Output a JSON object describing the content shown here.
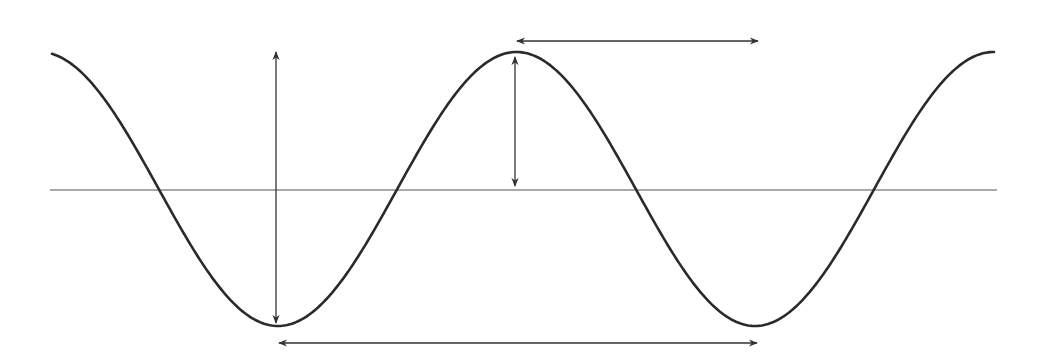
{
  "diagram": {
    "title": "",
    "colors": {
      "background": "#ffffff",
      "wave": "#2a2a2a",
      "axis": "#555555",
      "arrows": "#333333"
    },
    "axis": {
      "x1": 50,
      "y": 190,
      "x2": 997
    },
    "wave": {
      "x_start": 52,
      "x_end": 995,
      "center_y": 189,
      "amplitude": 137,
      "period": 477,
      "trough_x": 278,
      "stroke_width": 2.6
    },
    "arrows": [
      {
        "name": "trough-to-crest-height-arrow",
        "meaning": "wave height (crest to trough)",
        "orientation": "vertical",
        "x1": 276,
        "y1": 52,
        "x2": 276,
        "y2": 323
      },
      {
        "name": "amplitude-arrow",
        "meaning": "amplitude (crest to rest position)",
        "orientation": "vertical",
        "x1": 515,
        "y1": 57,
        "x2": 515,
        "y2": 186
      },
      {
        "name": "crest-to-crest-wavelength-arrow",
        "meaning": "horizontal span from crest",
        "orientation": "horizontal",
        "x1": 517,
        "y1": 41,
        "x2": 758,
        "y2": 41
      },
      {
        "name": "trough-to-trough-wavelength-arrow",
        "meaning": "wavelength (trough to trough)",
        "orientation": "horizontal",
        "x1": 279,
        "y1": 343,
        "x2": 757,
        "y2": 343
      }
    ]
  }
}
